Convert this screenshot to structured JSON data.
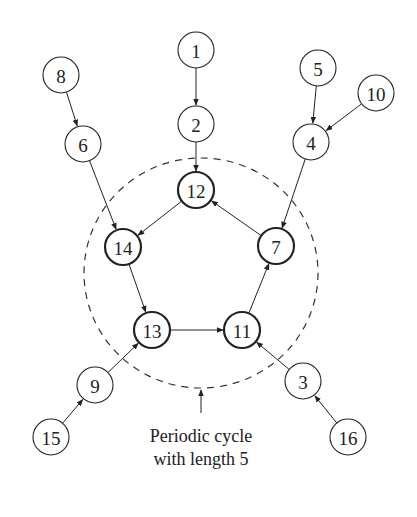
{
  "diagram": {
    "type": "functional-graph",
    "caption_line1": "Periodic cycle",
    "caption_line2": "with length 5",
    "colors": {
      "stroke": "#222222",
      "background": "#ffffff"
    },
    "cycle_region": {
      "cx": 201,
      "cy": 273,
      "rx": 117,
      "ry": 115,
      "style": "dashed"
    },
    "nodes": [
      {
        "id": "1",
        "label": "1",
        "x": 196,
        "y": 50,
        "in_cycle": false
      },
      {
        "id": "2",
        "label": "2",
        "x": 196,
        "y": 124,
        "in_cycle": false
      },
      {
        "id": "8",
        "label": "8",
        "x": 61,
        "y": 75,
        "in_cycle": false
      },
      {
        "id": "6",
        "label": "6",
        "x": 83,
        "y": 144,
        "in_cycle": false
      },
      {
        "id": "5",
        "label": "5",
        "x": 318,
        "y": 68,
        "in_cycle": false
      },
      {
        "id": "10",
        "label": "10",
        "x": 376,
        "y": 93,
        "in_cycle": false
      },
      {
        "id": "4",
        "label": "4",
        "x": 311,
        "y": 142,
        "in_cycle": false
      },
      {
        "id": "12",
        "label": "12",
        "x": 196,
        "y": 190,
        "in_cycle": true
      },
      {
        "id": "14",
        "label": "14",
        "x": 123,
        "y": 247,
        "in_cycle": true
      },
      {
        "id": "7",
        "label": "7",
        "x": 276,
        "y": 246,
        "in_cycle": true
      },
      {
        "id": "13",
        "label": "13",
        "x": 152,
        "y": 330,
        "in_cycle": true
      },
      {
        "id": "11",
        "label": "11",
        "x": 242,
        "y": 330,
        "in_cycle": true
      },
      {
        "id": "9",
        "label": "9",
        "x": 95,
        "y": 385,
        "in_cycle": false
      },
      {
        "id": "3",
        "label": "3",
        "x": 303,
        "y": 381,
        "in_cycle": false
      },
      {
        "id": "15",
        "label": "15",
        "x": 51,
        "y": 437,
        "in_cycle": false
      },
      {
        "id": "16",
        "label": "16",
        "x": 348,
        "y": 437,
        "in_cycle": false
      }
    ],
    "edges": [
      {
        "from": "1",
        "to": "2"
      },
      {
        "from": "2",
        "to": "12"
      },
      {
        "from": "8",
        "to": "6"
      },
      {
        "from": "6",
        "to": "14"
      },
      {
        "from": "5",
        "to": "4"
      },
      {
        "from": "10",
        "to": "4"
      },
      {
        "from": "4",
        "to": "7"
      },
      {
        "from": "12",
        "to": "14"
      },
      {
        "from": "14",
        "to": "13"
      },
      {
        "from": "13",
        "to": "11"
      },
      {
        "from": "11",
        "to": "7"
      },
      {
        "from": "7",
        "to": "12"
      },
      {
        "from": "9",
        "to": "13"
      },
      {
        "from": "15",
        "to": "9"
      },
      {
        "from": "3",
        "to": "11"
      },
      {
        "from": "16",
        "to": "3"
      }
    ],
    "caption_arrow": {
      "x": 201,
      "y1": 413,
      "y2": 390
    }
  }
}
